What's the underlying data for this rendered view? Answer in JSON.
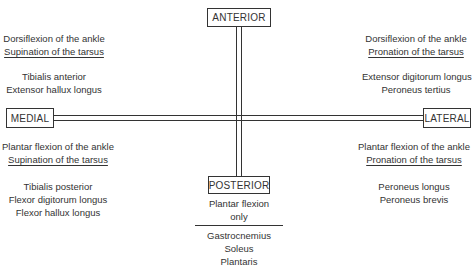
{
  "diagram": {
    "axes": {
      "anterior": "ANTERIOR",
      "posterior": "POSTERIOR",
      "medial": "MEDIAL",
      "lateral": "LATERAL"
    },
    "quadrants": {
      "anterior_medial": {
        "actions": [
          "Dorsiflexion of the ankle",
          "Supination of the tarsus"
        ],
        "muscles": [
          "Tibialis anterior",
          "Extensor hallux longus"
        ]
      },
      "anterior_lateral": {
        "actions": [
          "Dorsiflexion of the ankle",
          "Pronation of the tarsus"
        ],
        "muscles": [
          "Extensor digitorum longus",
          "Peroneus tertius"
        ]
      },
      "posterior_medial": {
        "actions": [
          "Plantar flexion of the ankle",
          "Supination of the tarsus"
        ],
        "muscles": [
          "Tibialis posterior",
          "Flexor digitorum longus",
          "Flexor hallux longus"
        ]
      },
      "posterior_lateral": {
        "actions": [
          "Plantar flexion of the ankle",
          "Pronation of the tarsus"
        ],
        "muscles": [
          "Peroneus longus",
          "Peroneus brevis"
        ]
      },
      "posterior_center": {
        "actions": [
          "Plantar flexion",
          "only"
        ],
        "muscles": [
          "Gastrocnemius",
          "Soleus",
          "Plantaris"
        ]
      }
    }
  }
}
